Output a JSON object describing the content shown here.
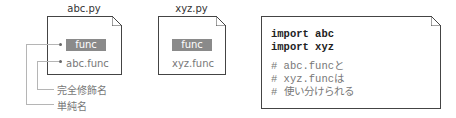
{
  "files": [
    {
      "name": "abc.py",
      "simple_name": "func",
      "qualified_name": "abc.func"
    },
    {
      "name": "xyz.py",
      "simple_name": "func",
      "qualified_name": "xyz.func"
    }
  ],
  "callouts": {
    "qualified_label": "完全修飾名",
    "simple_label": "単純名"
  },
  "code": {
    "lines": [
      "import abc",
      "import xyz",
      "# abc.funcと",
      "# xyz.funcは",
      "# 使い分けられる"
    ]
  },
  "colors": {
    "pill": "#8a8a8a",
    "border": "#444444",
    "leader_line": "#b5b5b5"
  }
}
